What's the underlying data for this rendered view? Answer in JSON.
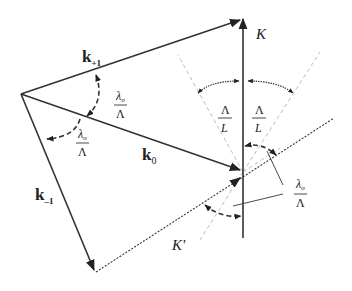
{
  "diagram": {
    "type": "wave-vector diffraction geometry",
    "colors": {
      "ink": "#333333",
      "cone": "#bdbdbd",
      "background": "#ffffff"
    },
    "vectors": [
      {
        "id": "k_plus1",
        "label_main": "k",
        "label_sub": "+1"
      },
      {
        "id": "k_0",
        "label_main": "k",
        "label_sub": "0"
      },
      {
        "id": "k_minus1",
        "label_main": "k",
        "label_sub": "–1"
      }
    ],
    "axes": {
      "K": {
        "label": "K"
      },
      "K_prime": {
        "label": "K'"
      }
    },
    "angle_labels": {
      "lambda_over_Lambda": {
        "num_main": "λ",
        "num_sub": "o",
        "den": "Λ"
      },
      "Lambda_over_L": {
        "num": "Λ",
        "den": "L"
      }
    }
  }
}
